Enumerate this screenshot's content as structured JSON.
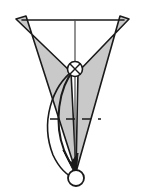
{
  "figure": {
    "type": "line-diagram",
    "canvas": {
      "width": 150,
      "height": 193,
      "background": "#ffffff"
    },
    "colors": {
      "stroke": "#1a1a1a",
      "wing_fill": "#c9c9c9",
      "wing_stroke": "#1a1a1a",
      "axis": "#4a4a4a",
      "node_fill": "#ffffff",
      "end_circle_fill": "#ffffff"
    },
    "shapes": {
      "left_wing": {
        "name": "left-wing-polygon",
        "points": "16,19 26,16 78,68 70,76",
        "fill": "#c9c9c9",
        "stroke": "#1a1a1a"
      },
      "right_wing": {
        "name": "right-wing-polygon",
        "points": "129,19 120,16 72,68 80,76",
        "fill": "#c9c9c9",
        "stroke": "#1a1a1a"
      },
      "left_blade": {
        "name": "left-blade-polygon",
        "points": "16,19 71,72 76,172 26,16",
        "fill": "#c9c9c9",
        "stroke": "#1a1a1a"
      },
      "right_blade": {
        "name": "right-blade-polygon",
        "points": "129,19 78,72 76,172 120,16",
        "fill": "#c9c9c9",
        "stroke": "#1a1a1a"
      }
    },
    "lines": {
      "top_chord": {
        "name": "top-horizontal-chord",
        "x1": 22,
        "y1": 20,
        "x2": 124,
        "y2": 20,
        "style": "solid",
        "width": 1.6
      },
      "vertical_axis": {
        "name": "vertical-axis-line",
        "x1": 75,
        "y1": 20,
        "x2": 75,
        "y2": 175,
        "style": "solid",
        "width": 1.2
      },
      "dashed_reference": {
        "name": "dashed-reference-line",
        "x1": 50,
        "y1": 119,
        "x2": 101,
        "y2": 119,
        "style": "dashed",
        "dash": "9 7",
        "width": 1.4
      }
    },
    "curves": {
      "outer_swing": {
        "name": "outer-swing-trajectory",
        "path": "M 74,70 C 52,86 40,122 53,155 C 60,170 68,176 76,179",
        "stroke": "#1a1a1a",
        "width": 1.6
      },
      "inner_swing": {
        "name": "inner-swing-trajectory-arrow",
        "path": "M 74,70 C 58,88 54,124 64,150 C 68,160 72,166 75,170",
        "stroke": "#1a1a1a",
        "width": 2.0,
        "arrowhead": true
      }
    },
    "nodes": {
      "pivot": {
        "name": "pivot-crossed-circle-node",
        "cx": 75,
        "cy": 69,
        "r": 7.5,
        "fill": "#ffffff",
        "stroke": "#1a1a1a",
        "cross": true
      },
      "endpoint": {
        "name": "endpoint-open-circle",
        "cx": 76,
        "cy": 178,
        "r": 8,
        "fill": "#ffffff",
        "stroke": "#1a1a1a"
      }
    },
    "arrowhead": {
      "name": "swing-arrowhead",
      "points": "76,176 63,150 71,163 78,153",
      "fill": "#1a1a1a"
    }
  }
}
